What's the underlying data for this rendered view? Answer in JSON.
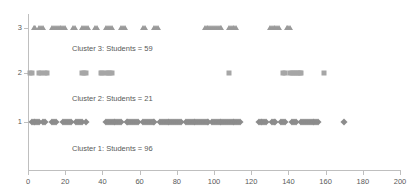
{
  "chart_data": {
    "type": "scatter",
    "title": "",
    "xlabel": "",
    "ylabel": "",
    "xlim": [
      0,
      200
    ],
    "ylim": [
      0.4,
      3.6
    ],
    "grid": false,
    "legend": "none",
    "x_ticks": [
      0,
      20,
      40,
      60,
      80,
      100,
      120,
      140,
      160,
      180,
      200
    ],
    "y_ticks": [
      1,
      2,
      3
    ],
    "marker_color": "#8c8c8c",
    "axis_color": "#bfbfbf",
    "text_color": "#595959",
    "series": [
      {
        "name": "Cluster 1",
        "y": 1,
        "marker": "diamond",
        "count": 96,
        "annotation": "Cluster 1: Students = 96",
        "values": [
          2,
          3,
          4,
          5,
          6,
          8,
          9,
          13,
          14,
          15,
          19,
          20,
          21,
          22,
          23,
          26,
          27,
          28,
          29,
          31,
          42,
          43,
          44,
          45,
          46,
          47,
          48,
          49,
          50,
          53,
          54,
          55,
          56,
          57,
          58,
          59,
          62,
          63,
          64,
          65,
          66,
          67,
          68,
          71,
          72,
          73,
          74,
          75,
          76,
          77,
          78,
          79,
          80,
          81,
          82,
          85,
          86,
          87,
          88,
          89,
          90,
          91,
          92,
          93,
          94,
          95,
          96,
          97,
          99,
          100,
          101,
          102,
          103,
          104,
          105,
          106,
          107,
          108,
          109,
          110,
          111,
          112,
          113,
          114,
          124,
          125,
          126,
          127,
          128,
          131,
          132,
          133,
          136,
          137,
          138,
          142,
          143,
          144,
          147,
          148,
          149,
          150,
          151,
          152,
          153,
          154,
          155,
          156,
          170
        ]
      },
      {
        "name": "Cluster 2",
        "y": 2,
        "marker": "square",
        "count": 21,
        "annotation": "Cluster 2: Students = 21",
        "values": [
          1,
          2,
          6,
          7,
          9,
          10,
          29,
          30,
          31,
          39,
          40,
          42,
          43,
          44,
          45,
          108,
          137,
          138,
          141,
          142,
          143,
          144,
          145,
          146,
          147,
          159
        ]
      },
      {
        "name": "Cluster 3",
        "y": 3,
        "marker": "triangle",
        "count": 59,
        "annotation": "Cluster 3: Students = 59",
        "values": [
          3,
          4,
          6,
          7,
          8,
          13,
          14,
          15,
          16,
          17,
          18,
          19,
          20,
          24,
          25,
          29,
          30,
          31,
          32,
          36,
          37,
          42,
          43,
          44,
          45,
          50,
          51,
          52,
          62,
          63,
          68,
          69,
          70,
          95,
          96,
          97,
          98,
          99,
          100,
          101,
          102,
          103,
          104,
          108,
          109,
          110,
          111,
          112,
          130,
          131,
          132,
          133,
          134,
          135,
          139,
          140,
          141
        ]
      }
    ],
    "annotations": [
      {
        "text": "Cluster 3: Students = 59",
        "x_px": 72,
        "y_px": 45
      },
      {
        "text": "Cluster 2: Students = 21",
        "x_px": 72,
        "y_px": 95
      },
      {
        "text": "Cluster 1: Students = 96",
        "x_px": 72,
        "y_px": 145
      }
    ]
  }
}
